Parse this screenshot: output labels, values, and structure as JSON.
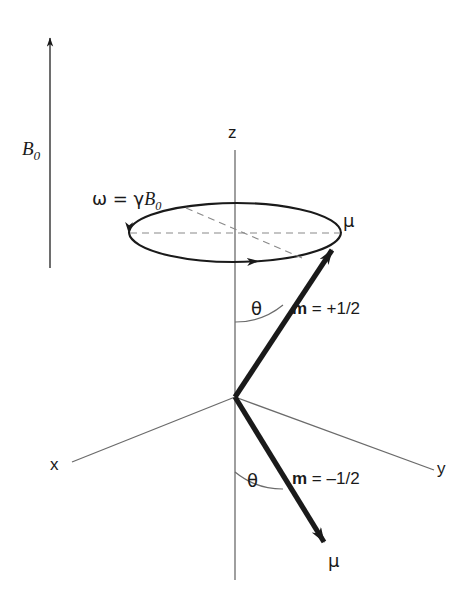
{
  "figure": {
    "background_color": "#ffffff",
    "ink_color": "#1a1a1a"
  },
  "labels": {
    "field_symbol": "B",
    "field_subscript": "0",
    "axis_z": "z",
    "axis_x": "x",
    "axis_y": "y",
    "larmor_omega": "ω",
    "larmor_equals": " = ",
    "larmor_gamma": "γ",
    "larmor_field": "B",
    "larmor_subscript": "0",
    "mu_upper": "μ",
    "mu_lower": "μ",
    "theta_upper": "θ",
    "theta_lower": "θ",
    "m_upper_symbol": "m",
    "m_upper_value": " = +1/2",
    "m_lower_symbol": "m",
    "m_lower_value": " = –1/2"
  },
  "geometry": {
    "origin_x": 235,
    "origin_y": 397,
    "z_axis_top_y": 150,
    "z_axis_bottom_y": 580,
    "ellipse_cx": 235,
    "ellipse_cy": 233,
    "ellipse_rx": 106,
    "ellipse_ry": 30,
    "mu_upper_tip_x": 335,
    "mu_upper_tip_y": 247,
    "mu_lower_tip_x": 327,
    "mu_lower_tip_y": 545,
    "b0_arrow_x": 50,
    "b0_arrow_top_y": 32,
    "b0_arrow_bottom_y": 268,
    "x_axis_end_x": 72,
    "x_axis_end_y": 462,
    "y_axis_end_x": 434,
    "y_axis_end_y": 470
  },
  "label_positions": {
    "field": {
      "x": 22,
      "y": 139
    },
    "larmor": {
      "x": 92,
      "y": 190
    },
    "axis_z": {
      "x": 228,
      "y": 124
    },
    "axis_x": {
      "x": 50,
      "y": 456
    },
    "axis_y": {
      "x": 437,
      "y": 460
    },
    "mu_upper": {
      "x": 343,
      "y": 212
    },
    "mu_lower": {
      "x": 328,
      "y": 552
    },
    "theta_upper": {
      "x": 251,
      "y": 300
    },
    "theta_lower": {
      "x": 247,
      "y": 472
    },
    "m_upper": {
      "x": 292,
      "y": 300
    },
    "m_lower": {
      "x": 292,
      "y": 470
    }
  }
}
